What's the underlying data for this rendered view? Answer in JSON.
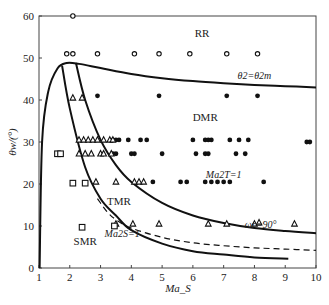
{
  "chart_data": {
    "type": "scatter",
    "title": "",
    "xlabel": "Ma_S",
    "ylabel": "θw/(°)",
    "xlim": [
      1,
      10
    ],
    "ylim": [
      0,
      60
    ],
    "grid": false,
    "x_ticks": [
      "1",
      "2",
      "3",
      "4",
      "5",
      "6",
      "7",
      "8",
      "9",
      "10"
    ],
    "y_ticks": [
      "0",
      "10",
      "20",
      "30",
      "40",
      "50",
      "60"
    ],
    "region_labels": [
      {
        "text": "RR",
        "x": 6.3,
        "y": 55
      },
      {
        "text": "DMR",
        "x": 6.4,
        "y": 35
      },
      {
        "text": "TMR",
        "x": 3.6,
        "y": 15
      },
      {
        "text": "SMR",
        "x": 2.5,
        "y": 5.5
      }
    ],
    "annotations": [
      {
        "text": "θ2=θ2m",
        "x": 8.0,
        "y": 45
      },
      {
        "text": "Ma2T=1",
        "x": 7.0,
        "y": 21.5
      },
      {
        "text": "ωr=90°",
        "x": 8.2,
        "y": 9.5
      },
      {
        "text": "Ma2S=1",
        "x": 3.7,
        "y": 7.5
      }
    ],
    "curves": [
      {
        "name": "θ2=θ2m",
        "style": "solid",
        "x": [
          1.02,
          1.1,
          1.3,
          1.6,
          1.9,
          2.3,
          3,
          4,
          5,
          6,
          7,
          8,
          9,
          10
        ],
        "y": [
          0,
          30,
          42,
          47.5,
          48.8,
          48.6,
          47.6,
          46.2,
          45.2,
          44.5,
          44,
          43.6,
          43.3,
          43
        ]
      },
      {
        "name": "Ma2T=1",
        "style": "solid",
        "x": [
          2.2,
          2.5,
          3,
          3.5,
          4,
          5,
          6,
          7,
          8,
          9,
          10
        ],
        "y": [
          48.8,
          40,
          30.5,
          24.5,
          20.5,
          15.5,
          12.5,
          10.7,
          9.5,
          8.8,
          8.3
        ]
      },
      {
        "name": "ωr=90°",
        "style": "dashed",
        "x": [
          2.9,
          3.2,
          3.5,
          4,
          5,
          6,
          7,
          8,
          9,
          10
        ],
        "y": [
          16.5,
          13.5,
          11.5,
          9.5,
          7.3,
          6,
          5.3,
          4.8,
          4.5,
          4.2
        ]
      },
      {
        "name": "Ma2S=1",
        "style": "solid",
        "x": [
          1.75,
          2,
          2.5,
          3,
          3.5,
          4,
          5,
          6,
          7,
          8,
          9.1
        ],
        "y": [
          48.2,
          38,
          24,
          16.5,
          12.5,
          9,
          5.8,
          4,
          3.2,
          2.5,
          2.2
        ]
      }
    ],
    "series": [
      {
        "name": "RR",
        "marker": "open-circle",
        "x": [
          2.1,
          1.9,
          2.1,
          2.9,
          4.1,
          4.9,
          5.9,
          7.1,
          8.1
        ],
        "y": [
          60,
          51,
          51,
          51,
          51,
          51,
          51,
          51,
          51
        ]
      },
      {
        "name": "DMR",
        "marker": "filled-circle",
        "x": [
          2.9,
          4.9,
          7.1,
          8.1,
          3.4,
          3.5,
          3.6,
          3.9,
          4.3,
          4.5,
          6.0,
          6.4,
          6.5,
          6.6,
          7.2,
          7.5,
          7.8,
          9.7,
          9.8,
          3.4,
          3.5,
          4.0,
          4.1,
          5.0,
          6.1,
          6.4,
          6.5,
          7.4,
          7.7,
          4.7,
          5.6,
          5.8,
          6.4,
          6.6,
          6.8,
          7.0,
          7.2,
          8.3
        ],
        "y": [
          41,
          41,
          41,
          41,
          30.5,
          30.5,
          30.5,
          30.5,
          30.5,
          30.5,
          30.5,
          30.5,
          30.5,
          30.5,
          30.5,
          30.5,
          30.5,
          30,
          30,
          27.2,
          27.2,
          27.2,
          27.2,
          27.2,
          27.2,
          27.2,
          27.2,
          27.2,
          27.2,
          20.5,
          20.5,
          20.5,
          20.5,
          20.5,
          20.5,
          20.5,
          20.5,
          20.5
        ]
      },
      {
        "name": "TMR",
        "marker": "open-triangle",
        "x": [
          2.1,
          2.4,
          2.3,
          2.45,
          2.6,
          2.75,
          2.9,
          3.1,
          3.3,
          3.4,
          2.3,
          2.5,
          2.7,
          3.0,
          3.1,
          3.35,
          2.85,
          3.5,
          4.1,
          4.25,
          4.4,
          3.5,
          4.05,
          4.9,
          6.5,
          7.1,
          8.0,
          8.15,
          9.3
        ],
        "y": [
          40.5,
          40.5,
          30.5,
          30.5,
          30.5,
          30.5,
          30.5,
          30.5,
          30.5,
          30.5,
          27.2,
          27.2,
          27.2,
          27.2,
          27.2,
          27.2,
          20.5,
          20.5,
          20.5,
          20.5,
          20.5,
          10.5,
          10.5,
          10.5,
          10.5,
          10.5,
          10.5,
          10.8,
          10.5
        ]
      },
      {
        "name": "SMR",
        "marker": "open-square",
        "x": [
          1.6,
          1.7,
          2.1,
          2.5,
          2.4,
          3.45
        ],
        "y": [
          27.2,
          27.2,
          20.2,
          20.2,
          9.7,
          10.0
        ]
      }
    ]
  }
}
